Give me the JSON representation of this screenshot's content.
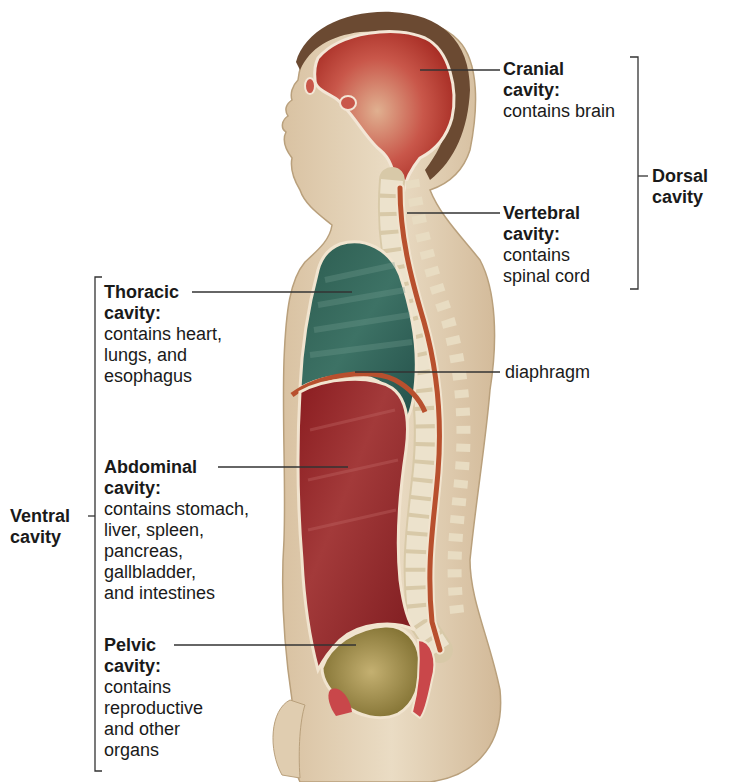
{
  "diagram": {
    "groups": [
      {
        "id": "dorsal",
        "label_line1": "Dorsal",
        "label_line2": "cavity"
      },
      {
        "id": "ventral",
        "label_line1": "Ventral",
        "label_line2": "cavity"
      }
    ],
    "labels": {
      "cranial": {
        "title_line1": "Cranial",
        "title_line2": "cavity:",
        "desc": [
          "contains brain"
        ]
      },
      "vertebral": {
        "title_line1": "Vertebral",
        "title_line2": "cavity:",
        "desc": [
          "contains",
          "spinal cord"
        ]
      },
      "thoracic": {
        "title_line1": "Thoracic",
        "title_line2": "cavity:",
        "desc": [
          "contains heart,",
          "lungs, and",
          "esophagus"
        ]
      },
      "diaphragm": {
        "text": "diaphragm"
      },
      "abdominal": {
        "title_line1": "Abdominal",
        "title_line2": "cavity:",
        "desc": [
          "contains stomach,",
          "liver, spleen,",
          "pancreas,",
          "gallbladder,",
          "and intestines"
        ]
      },
      "pelvic": {
        "title_line1": "Pelvic",
        "title_line2": "cavity:",
        "desc": [
          "contains",
          "reproductive",
          "and other",
          "organs"
        ]
      }
    },
    "colors": {
      "skin": "#e6d3b8",
      "hair": "#6b4a32",
      "cranial": "#b8322a",
      "thoracic": "#2f5f52",
      "abdominal": "#8e1f24",
      "pelvic": "#8d7a3a",
      "spinal_cord": "#b8502e",
      "vertebra": "#ece2cc",
      "line": "#333333"
    }
  }
}
